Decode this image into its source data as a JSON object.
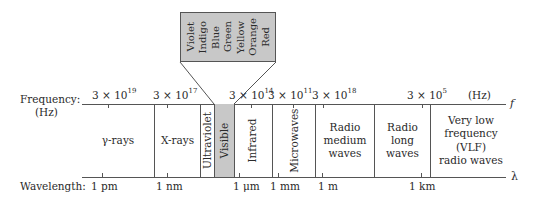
{
  "diagram": {
    "frequency_axis": {
      "label": "Frequency:",
      "unit_label": "(Hz)",
      "unit_right": "(Hz)",
      "symbol": "f",
      "ticks": [
        {
          "base": "3 × 10",
          "exp": "19"
        },
        {
          "base": "3 × 10",
          "exp": "17"
        },
        {
          "base": "3 × 10",
          "exp": "14"
        },
        {
          "base": "3 × 10",
          "exp": "11"
        },
        {
          "base": "3 × 10",
          "exp": "18"
        },
        {
          "base": "3 × 10",
          "exp": "5"
        }
      ]
    },
    "wavelength_axis": {
      "label": "Wavelength:",
      "symbol": "λ",
      "ticks": [
        "1 pm",
        "1 nm",
        "1 μm",
        "1 mm",
        "1 m",
        "1 km"
      ]
    },
    "regions": [
      {
        "name": "γ-rays"
      },
      {
        "name": "X-rays"
      },
      {
        "name": "Ultraviolet"
      },
      {
        "name": "Visible"
      },
      {
        "name": "Infrared"
      },
      {
        "name": "Microwaves"
      },
      {
        "name": "Radio medium waves",
        "lines": [
          "Radio",
          "medium",
          "waves"
        ]
      },
      {
        "name": "Radio long waves",
        "lines": [
          "Radio",
          "long",
          "waves"
        ]
      },
      {
        "name": "Very low frequency (VLF) radio waves",
        "lines": [
          "Very low",
          "frequency (VLF)",
          "radio waves"
        ]
      }
    ],
    "visible_callout": {
      "colors": [
        "Violet",
        "Indigo",
        "Blue",
        "Green",
        "Yellow",
        "Orange",
        "Red"
      ]
    },
    "colors": {
      "visible_fill": "#c8c8c8",
      "line": "#555555",
      "text": "#2a2a2a"
    }
  }
}
